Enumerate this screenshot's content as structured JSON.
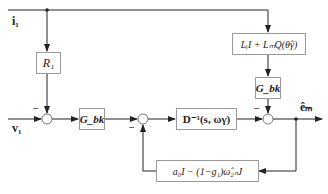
{
  "inputs": {
    "i1": "i₁",
    "v1": "v₁"
  },
  "output": {
    "e_m": "êₘ"
  },
  "blocks": {
    "R1": "R₁",
    "G_bk_forward": "G_bk",
    "D_inv": "D⁻¹(s, ωγ)",
    "L_block": "LᵢI + LₘQ(θ̂γ)",
    "G_bk_feedthrough": "G_bk",
    "feedback": "a₀I − (1−g₁)ω̂₂ₙJ"
  },
  "signs": {
    "sum1_top": "−",
    "sum2_bottom": "−",
    "sum3_top": "−"
  },
  "colors": {
    "line": "#222222",
    "block_border": "#9a9a9a"
  }
}
